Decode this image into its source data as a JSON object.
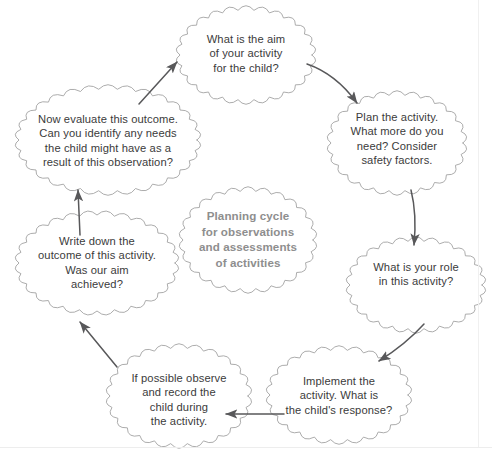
{
  "diagram": {
    "title": "Planning cycle for observations and assessments of activities",
    "type": "cycle-flowchart",
    "direction": "clockwise",
    "colors": {
      "bubble_outline": "#9d9d9d",
      "bubble_fill": "#ffffff",
      "node_text": "#3b3b3b",
      "center_text": "#8e8e8e",
      "arrow": "#58585a",
      "page_background": "#ffffff",
      "page_edge": "#ebebeb"
    },
    "center": {
      "label": "Planning cycle\nfor observations\nand assessments\nof activities"
    },
    "nodes": [
      {
        "id": "aim",
        "label": "What is the aim\nof your activity\nfor the child?",
        "position": "top"
      },
      {
        "id": "plan",
        "label": "Plan the activity.\nWhat more do you\nneed? Consider\nsafety factors.",
        "position": "top-right"
      },
      {
        "id": "role",
        "label": "What is your role\nin this activity?",
        "position": "right"
      },
      {
        "id": "implement",
        "label": "Implement the\nactivity. What is\nthe child's response?",
        "position": "bottom-right"
      },
      {
        "id": "observe",
        "label": "If possible observe\nand record the\nchild during\nthe activity.",
        "position": "bottom-left"
      },
      {
        "id": "outcome",
        "label": "Write down the\noutcome of this activity.\nWas our aim\nachieved?",
        "position": "left"
      },
      {
        "id": "evaluate",
        "label": "Now evaluate this outcome.\nCan you identify any needs\nthe child might have as a\nresult of this observation?",
        "position": "top-left"
      }
    ],
    "arrows": [
      {
        "id": "arrow-evaluate-to-aim",
        "from": "evaluate",
        "to": "aim",
        "shape": "straight"
      },
      {
        "id": "arrow-aim-to-plan",
        "from": "aim",
        "to": "plan",
        "shape": "curved"
      },
      {
        "id": "arrow-plan-to-role",
        "from": "plan",
        "to": "role",
        "shape": "curved"
      },
      {
        "id": "arrow-role-to-implement",
        "from": "role",
        "to": "implement",
        "shape": "curved"
      },
      {
        "id": "arrow-implement-to-observe",
        "from": "implement",
        "to": "observe",
        "shape": "straight"
      },
      {
        "id": "arrow-observe-to-outcome",
        "from": "observe",
        "to": "outcome",
        "shape": "straight"
      },
      {
        "id": "arrow-outcome-to-evaluate",
        "from": "outcome",
        "to": "evaluate",
        "shape": "straight"
      }
    ]
  }
}
